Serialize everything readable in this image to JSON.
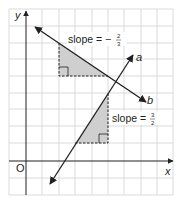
{
  "diagram": {
    "axes": {
      "x_label": "x",
      "y_label": "y",
      "origin_label": "O"
    },
    "lines": [
      {
        "name": "a",
        "label": "a",
        "slope_text": "slope = ",
        "slope_sign": "",
        "slope_num": "3",
        "slope_den": "2"
      },
      {
        "name": "b",
        "label": "b",
        "slope_text": "slope = ",
        "slope_sign": "−",
        "slope_num": "2",
        "slope_den": "3"
      }
    ],
    "colors": {
      "grid": "#c8c8c8",
      "axis": "#231f20",
      "line": "#231f20",
      "triangle_fill": "#cfcfcf",
      "background": "#ffffff"
    }
  }
}
